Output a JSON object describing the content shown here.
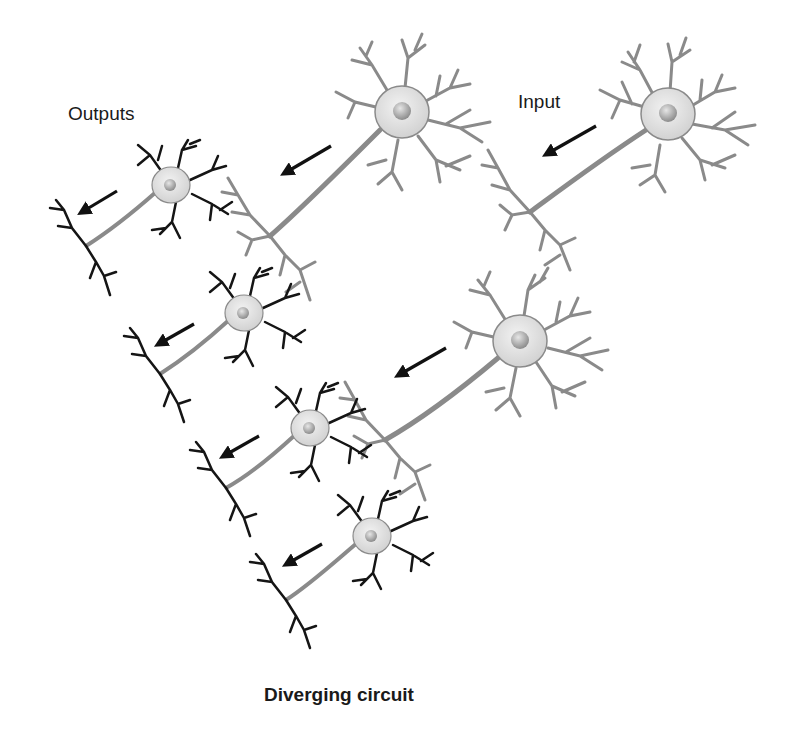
{
  "diagram": {
    "title": "Diverging circuit",
    "labels": {
      "outputs": "Outputs",
      "input": "Input"
    },
    "colors": {
      "background": "#ffffff",
      "relay_neuron_fill": "#e4e4e4",
      "relay_neuron_stroke": "#8a8a8a",
      "output_neuron_fill": "#e8e8e8",
      "output_dendrite": "#151515",
      "arrow": "#111111",
      "text": "#1a1a1a"
    },
    "neurons": [
      {
        "id": "input-neuron",
        "role": "input",
        "style": "gray",
        "soma": [
          668,
          114
        ]
      },
      {
        "id": "relay-neuron-upper",
        "role": "relay",
        "style": "gray",
        "soma": [
          402,
          112
        ]
      },
      {
        "id": "relay-neuron-lower",
        "role": "relay",
        "style": "gray",
        "soma": [
          520,
          341
        ]
      },
      {
        "id": "output-neuron-1",
        "role": "output",
        "style": "black",
        "soma": [
          171,
          185
        ]
      },
      {
        "id": "output-neuron-2",
        "role": "output",
        "style": "black",
        "soma": [
          244,
          313
        ]
      },
      {
        "id": "output-neuron-3",
        "role": "output",
        "style": "black",
        "soma": [
          310,
          428
        ]
      },
      {
        "id": "output-neuron-4",
        "role": "output",
        "style": "black",
        "soma": [
          372,
          536
        ]
      }
    ],
    "arrows": [
      {
        "id": "arrow-input",
        "from": [
          596,
          126
        ],
        "to": [
          548,
          153
        ]
      },
      {
        "id": "arrow-relay-upper",
        "from": [
          331,
          146
        ],
        "to": [
          286,
          172
        ]
      },
      {
        "id": "arrow-relay-lower",
        "from": [
          446,
          348
        ],
        "to": [
          400,
          374
        ]
      },
      {
        "id": "arrow-output-1",
        "from": [
          117,
          191
        ],
        "to": [
          83,
          211
        ]
      },
      {
        "id": "arrow-output-2",
        "from": [
          194,
          324
        ],
        "to": [
          160,
          343
        ]
      },
      {
        "id": "arrow-output-3",
        "from": [
          259,
          436
        ],
        "to": [
          225,
          455
        ]
      },
      {
        "id": "arrow-output-4",
        "from": [
          322,
          544
        ],
        "to": [
          288,
          563
        ]
      }
    ]
  }
}
